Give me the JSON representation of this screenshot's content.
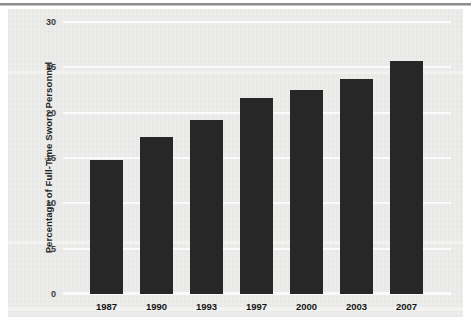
{
  "figure": {
    "background_color": "#ececeb",
    "bar_color": "#272727",
    "gridline_color": "#fbfbfb"
  },
  "chart_data": {
    "type": "bar",
    "title": "",
    "xlabel": "",
    "ylabel": "Percentage of Full-Time Sworn Personnel",
    "categories": [
      "1987",
      "1990",
      "1993",
      "1997",
      "2000",
      "2003",
      "2007"
    ],
    "values": [
      14.8,
      17.3,
      19.2,
      21.6,
      22.5,
      23.7,
      25.7
    ],
    "ylim": [
      0,
      30
    ],
    "ytick_labels": [
      "0",
      "5",
      "10",
      "15",
      "20",
      "25",
      "30"
    ],
    "ytick_values": [
      0,
      5,
      10,
      15,
      20,
      25,
      30
    ],
    "grid": true,
    "grid_axis": "y",
    "legend": false,
    "legend_position": "none",
    "series": [
      {
        "name": "Percentage of Full-Time Sworn Personnel",
        "color": "#272727",
        "values": [
          14.8,
          17.3,
          19.2,
          21.6,
          22.5,
          23.7,
          25.7
        ]
      }
    ]
  }
}
